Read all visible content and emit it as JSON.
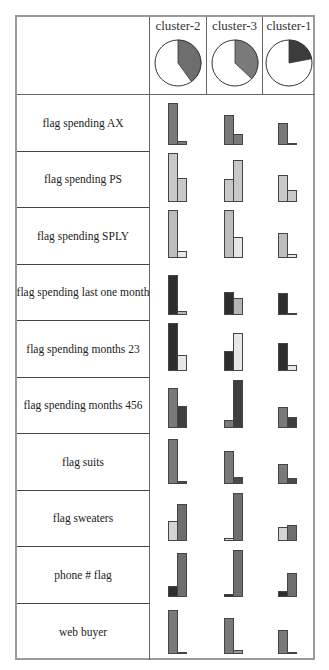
{
  "chart_data": {
    "type": "bar",
    "title": "",
    "clusters": [
      "cluster-2",
      "cluster-3",
      "cluster-1"
    ],
    "pies": [
      {
        "cluster": "cluster-2",
        "fraction": 0.4,
        "color": "#6e6e6e"
      },
      {
        "cluster": "cluster-3",
        "fraction": 0.37,
        "color": "#7a7a7a"
      },
      {
        "cluster": "cluster-1",
        "fraction": 0.22,
        "color": "#3c3c3c"
      }
    ],
    "categories": [
      "flag spending AX",
      "flag spending PS",
      "flag spending SPLY",
      "flag spending last one month",
      "flag spending months 23",
      "flag spending months 456",
      "flag suits",
      "flag sweaters",
      "phone # flag",
      "web buyer"
    ],
    "rows": [
      {
        "label": "flag spending AX",
        "colors": [
          "#7a7a7a",
          "#7a7a7a"
        ],
        "values": {
          "cluster-2": [
            42,
            4
          ],
          "cluster-3": [
            30,
            11
          ],
          "cluster-1": [
            22,
            2
          ]
        }
      },
      {
        "label": "flag spending PS",
        "colors": [
          "#c8c8c8",
          "#c8c8c8"
        ],
        "values": {
          "cluster-2": [
            49,
            24
          ],
          "cluster-3": [
            23,
            42
          ],
          "cluster-1": [
            27,
            12
          ]
        }
      },
      {
        "label": "flag spending SPLY",
        "colors": [
          "#bdbdbd",
          "#e6e6e6"
        ],
        "values": {
          "cluster-2": [
            48,
            7
          ],
          "cluster-3": [
            48,
            21
          ],
          "cluster-1": [
            25,
            4
          ]
        }
      },
      {
        "label": "flag spending last one month",
        "colors": [
          "#2e2e2e",
          "#b5b5b5"
        ],
        "values": {
          "cluster-2": [
            40,
            4
          ],
          "cluster-3": [
            23,
            17
          ],
          "cluster-1": [
            22,
            2
          ]
        }
      },
      {
        "label": "flag spending months 23",
        "colors": [
          "#2e2e2e",
          "#e6e6e6"
        ],
        "values": {
          "cluster-2": [
            48,
            16
          ],
          "cluster-3": [
            20,
            38
          ],
          "cluster-1": [
            28,
            6
          ]
        }
      },
      {
        "label": "flag spending months 456",
        "colors": [
          "#7a7a7a",
          "#3e3e3e"
        ],
        "values": {
          "cluster-2": [
            40,
            22
          ],
          "cluster-3": [
            8,
            48
          ],
          "cluster-1": [
            21,
            11
          ]
        }
      },
      {
        "label": "flag suits",
        "colors": [
          "#7a7a7a",
          "#4a4a4a"
        ],
        "values": {
          "cluster-2": [
            45,
            3
          ],
          "cluster-3": [
            33,
            7
          ],
          "cluster-1": [
            20,
            6
          ]
        }
      },
      {
        "label": "flag sweaters",
        "colors": [
          "#d4d4d4",
          "#6e6e6e"
        ],
        "values": {
          "cluster-2": [
            20,
            37
          ],
          "cluster-3": [
            3,
            48
          ],
          "cluster-1": [
            14,
            16
          ]
        }
      },
      {
        "label": "phone # flag",
        "colors": [
          "#2e2e2e",
          "#6e6e6e"
        ],
        "values": {
          "cluster-2": [
            11,
            44
          ],
          "cluster-3": [
            3,
            47
          ],
          "cluster-1": [
            6,
            24
          ]
        }
      },
      {
        "label": "web buyer",
        "colors": [
          "#7a7a7a",
          "#9a9a9a"
        ],
        "values": {
          "cluster-2": [
            44,
            2
          ],
          "cluster-3": [
            36,
            4
          ],
          "cluster-1": [
            24,
            2
          ]
        }
      }
    ],
    "xlabel": "",
    "ylabel": "",
    "grid": false,
    "legend": "none"
  },
  "header": {
    "clusters": [
      {
        "label": "cluster-2"
      },
      {
        "label": "cluster-3"
      },
      {
        "label": "cluster-1"
      }
    ]
  }
}
